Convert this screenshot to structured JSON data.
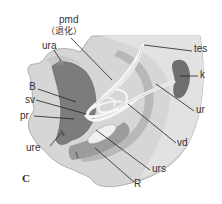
{
  "figure": {
    "panel_label": "C",
    "labels": {
      "pmd": "pmd",
      "pmd_note": "（退化）",
      "ura": "ura",
      "tes": "tes",
      "k": "k",
      "B": "B",
      "sv": "sv",
      "pr": "pr",
      "ur": "ur",
      "vd": "vd",
      "ure": "ure",
      "urs": "urs",
      "R": "R"
    },
    "colors": {
      "outer_body": "#d4d4d4",
      "outer_edge": "#9a9a9a",
      "inner_region": "#c2c2c2",
      "bladder": "#7a7a7a",
      "rectum": "#a8a8a8",
      "kidney": "#6e6e6e",
      "ducts": "#f4f4f4",
      "leader_lines": "#222222"
    }
  }
}
